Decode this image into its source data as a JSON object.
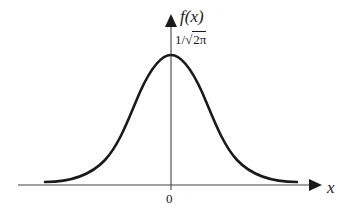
{
  "diagram": {
    "y_axis": {
      "label": "f(x)"
    },
    "x_axis": {
      "label": "x",
      "origin_tick": "0"
    },
    "peak_label": {
      "prefix": "1/",
      "radical": "√",
      "radicand": "2π"
    },
    "curve": {
      "type": "bell-curve",
      "description": "Gaussian density, symmetric about 0, maximum 1/√(2π) at x=0"
    },
    "colors": {
      "stroke": "#1a1a1a",
      "background": "#ffffff"
    }
  }
}
